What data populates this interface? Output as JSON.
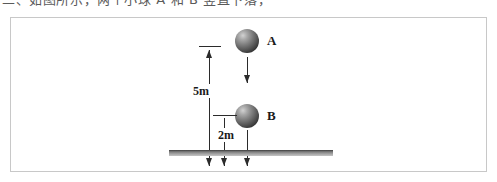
{
  "caption": {
    "text": "二、如图所示，两个小球 A 和 B 竖直下落，"
  },
  "figure": {
    "background_color": "#ffffff",
    "frame_color": "#c8c8c8",
    "line_color": "#2b2b2b",
    "ground_color": "#8e8e8e",
    "balls": [
      {
        "id": "A",
        "label": "A",
        "name": "ball-a"
      },
      {
        "id": "B",
        "label": "B",
        "name": "ball-b"
      }
    ],
    "dimensions": [
      {
        "id": "d5",
        "label": "5m",
        "value": 5,
        "unit": "m",
        "description": "vertical distance from ball A level down to ground"
      },
      {
        "id": "d2",
        "label": "2m",
        "value": 2,
        "unit": "m",
        "description": "vertical distance from ball B down to ground"
      }
    ],
    "vectors": [
      {
        "id": "va",
        "direction": "down",
        "attached_to": "A"
      },
      {
        "id": "vb",
        "direction": "down",
        "attached_to": "B"
      }
    ],
    "ground": {
      "label": "ground"
    }
  }
}
